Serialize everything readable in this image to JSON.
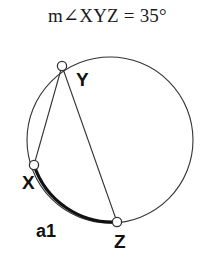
{
  "figure": {
    "title": "m∠XYZ = 35°",
    "angle_measure": 35,
    "angle_unit": "degrees",
    "angle_name": "XYZ",
    "stroke_color": "#333333",
    "bold_stroke_color": "#111111",
    "background": "#ffffff",
    "circle": {
      "center_x": 110,
      "center_y": 140,
      "radius": 83
    },
    "points": [
      {
        "id": "Y",
        "label": "Y",
        "x": 62,
        "y": 66
      },
      {
        "id": "X",
        "label": "X",
        "x": 34,
        "y": 165
      },
      {
        "id": "Z",
        "label": "Z",
        "x": 117,
        "y": 222
      }
    ],
    "chords": [
      {
        "from": "Y",
        "to": "X"
      },
      {
        "from": "Y",
        "to": "Z"
      }
    ],
    "arcs": [
      {
        "id": "a1",
        "label": "a1",
        "from": "X",
        "to": "Z",
        "highlighted": true
      }
    ],
    "labels": {
      "Y": "Y",
      "X": "X",
      "Z": "Z",
      "a1": "a1"
    }
  }
}
